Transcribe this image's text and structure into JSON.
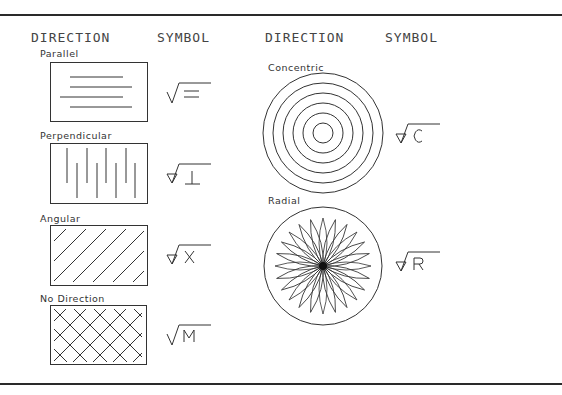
{
  "headers": {
    "left_direction": "DIRECTION",
    "left_symbol": "SYMBOL",
    "right_direction": "DIRECTION",
    "right_symbol": "SYMBOL"
  },
  "left_column": [
    {
      "label": "Parallel",
      "pattern": "parallel-lines",
      "symbol_letter": "=",
      "symbol_style": "checkmark"
    },
    {
      "label": "Perpendicular",
      "pattern": "perpendicular-lines",
      "symbol_letter": "⊥",
      "symbol_style": "triangle"
    },
    {
      "label": "Angular",
      "pattern": "angular-hatch",
      "symbol_letter": "X",
      "symbol_style": "triangle"
    },
    {
      "label": "No Direction",
      "pattern": "cross-hatch",
      "symbol_letter": "M",
      "symbol_style": "checkmark"
    }
  ],
  "right_column": [
    {
      "label": "Concentric",
      "pattern": "concentric-circles",
      "symbol_letter": "C",
      "symbol_style": "triangle"
    },
    {
      "label": "Radial",
      "pattern": "radial-petals",
      "symbol_letter": "R",
      "symbol_style": "triangle"
    }
  ],
  "colors": {
    "line": "#333333",
    "rule": "#2a2a2a",
    "background": "#ffffff"
  }
}
